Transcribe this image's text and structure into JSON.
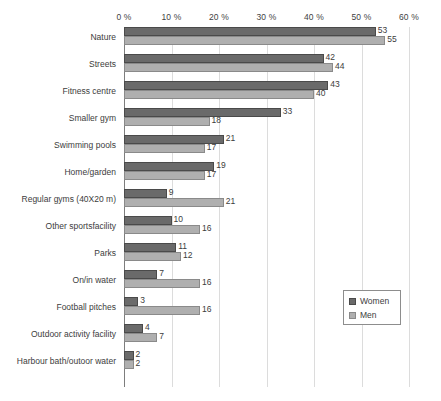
{
  "chart_data": {
    "type": "bar",
    "orientation": "horizontal",
    "title": "",
    "subtitle": "",
    "xlabel": "",
    "ylabel": "",
    "xlim": [
      0,
      60
    ],
    "grid": true,
    "legend_position": "right-lower",
    "axis_tick_labels": [
      "0 %",
      "10 %",
      "20 %",
      "30 %",
      "40 %",
      "50 %",
      "60 %"
    ],
    "axis_tick_values": [
      0,
      10,
      20,
      30,
      40,
      50,
      60
    ],
    "categories": [
      "Nature",
      "Streets",
      "Fitness centre",
      "Smaller gym",
      "Swimming pools",
      "Home/garden",
      "Regular gyms (40X20 m)",
      "Other sportsfacility",
      "Parks",
      "On/in water",
      "Football pitches",
      "Outdoor activity facility",
      "Harbour bath/outoor water"
    ],
    "series": [
      {
        "name": "Women",
        "color": "#6a6a6a",
        "values": [
          53,
          42,
          43,
          33,
          21,
          19,
          9,
          10,
          11,
          7,
          3,
          4,
          2
        ]
      },
      {
        "name": "Men",
        "color": "#afafaf",
        "values": [
          55,
          44,
          40,
          18,
          17,
          17,
          21,
          16,
          12,
          16,
          16,
          7,
          2
        ]
      }
    ]
  },
  "legend": {
    "items": [
      {
        "label": "Women",
        "swatch": "women"
      },
      {
        "label": "Men",
        "swatch": "men"
      }
    ]
  }
}
